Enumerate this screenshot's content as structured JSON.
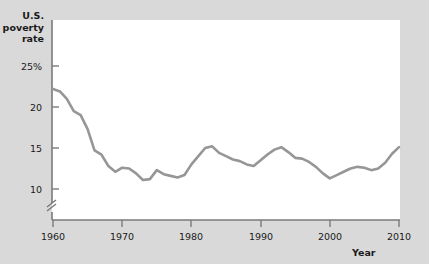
{
  "chart_data": {
    "type": "line",
    "title": "",
    "ylabel": "U.S.\npoverty\nrate",
    "xlabel": "Year",
    "ylabel_lines": [
      "U.S.",
      "poverty",
      "rate"
    ],
    "y_ticks": [
      "25%",
      "20",
      "15",
      "10"
    ],
    "y_tick_values": [
      25,
      20,
      15,
      10
    ],
    "x_ticks": [
      "1960",
      "1970",
      "1980",
      "1990",
      "2000",
      "2010"
    ],
    "x_tick_values": [
      1960,
      1970,
      1980,
      1990,
      2000,
      2010
    ],
    "xlim": [
      1960,
      2010
    ],
    "ylim": [
      8.5,
      26.0
    ],
    "axis_break": true,
    "axis_break_note": "y-axis broken below 10",
    "grid": false,
    "legend": "none",
    "line_color": "#969696",
    "series": [
      {
        "name": "U.S. poverty rate",
        "x": [
          1960,
          1961,
          1962,
          1963,
          1964,
          1965,
          1966,
          1967,
          1968,
          1969,
          1970,
          1971,
          1972,
          1973,
          1974,
          1975,
          1976,
          1977,
          1978,
          1979,
          1980,
          1981,
          1982,
          1983,
          1984,
          1985,
          1986,
          1987,
          1988,
          1989,
          1990,
          1991,
          1992,
          1993,
          1994,
          1995,
          1996,
          1997,
          1998,
          1999,
          2000,
          2001,
          2002,
          2003,
          2004,
          2005,
          2006,
          2007,
          2008,
          2009,
          2010
        ],
        "values": [
          22.2,
          21.9,
          21.0,
          19.5,
          19.0,
          17.3,
          14.7,
          14.2,
          12.8,
          12.1,
          12.6,
          12.5,
          11.9,
          11.1,
          11.2,
          12.3,
          11.8,
          11.6,
          11.4,
          11.7,
          13.0,
          14.0,
          15.0,
          15.2,
          14.4,
          14.0,
          13.6,
          13.4,
          13.0,
          12.8,
          13.5,
          14.2,
          14.8,
          15.1,
          14.5,
          13.8,
          13.7,
          13.3,
          12.7,
          11.9,
          11.3,
          11.7,
          12.1,
          12.5,
          12.7,
          12.6,
          12.3,
          12.5,
          13.2,
          14.3,
          15.1
        ]
      }
    ]
  }
}
